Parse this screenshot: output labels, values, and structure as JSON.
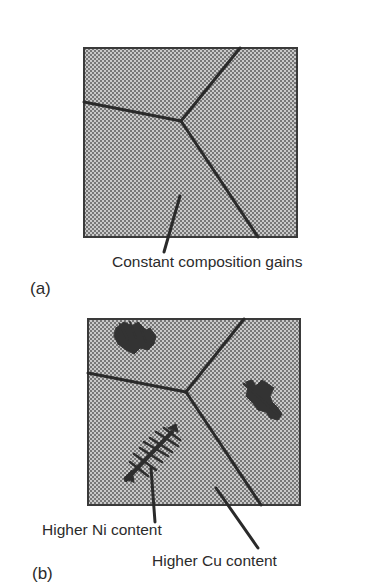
{
  "figure": {
    "panel_a": {
      "tag": "(a)",
      "annotation": "Constant composition gains",
      "description": "Polycrystalline microstructure with three grains meeting at a triple junction"
    },
    "panel_b": {
      "tag": "(b)",
      "annotations": {
        "ni": "Higher Ni content",
        "cu": "Higher Cu content"
      },
      "description": "Same grain structure with dendritic cored regions (segregation) inside grains"
    },
    "colors": {
      "fill": "#b8b8b8",
      "dot": "#7a7a7a",
      "boundary": "#2a2a2a",
      "dendrite": "#333333",
      "text": "#2b2b2b"
    }
  }
}
